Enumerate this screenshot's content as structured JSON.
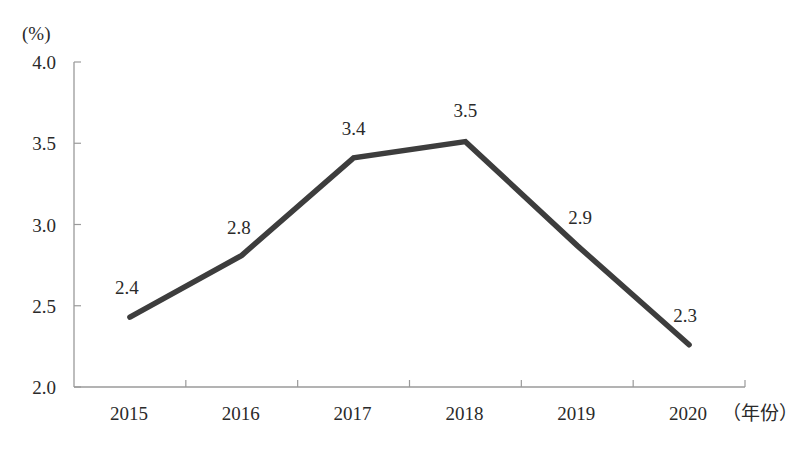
{
  "chart_data": {
    "type": "line",
    "title": "",
    "ylabel": "(%)",
    "xlabel": "（年份）",
    "categories": [
      "2015",
      "2016",
      "2017",
      "2018",
      "2019",
      "2020"
    ],
    "series": [
      {
        "name": "rate",
        "values": [
          2.43,
          2.81,
          3.41,
          3.51,
          2.87,
          2.26
        ],
        "labels": [
          "2.4",
          "2.8",
          "3.4",
          "3.5",
          "2.9",
          "2.3"
        ],
        "color": "#3d3d3d"
      }
    ],
    "yticks": [
      "2.0",
      "2.5",
      "3.0",
      "3.5",
      "4.0"
    ],
    "ylim": [
      2.0,
      4.0
    ],
    "grid": false,
    "legend": null
  },
  "colors": {
    "line": "#3d3d3d",
    "axis": "#9a9a9a",
    "text": "#2a2a2a"
  }
}
